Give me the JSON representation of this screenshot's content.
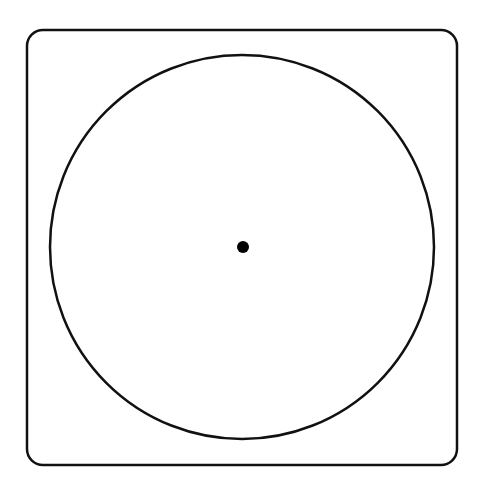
{
  "diagram": {
    "frame": {
      "x": 27,
      "y": 30,
      "width": 430,
      "height": 435,
      "corner_radius": 16,
      "stroke": "#111111",
      "stroke_width": 2.5
    },
    "circle": {
      "cx": 242,
      "cy": 247,
      "r": 192,
      "stroke": "#111111",
      "stroke_width": 2.5
    },
    "center_dot": {
      "cx": 243,
      "cy": 247,
      "r": 6,
      "fill": "#000000"
    }
  }
}
